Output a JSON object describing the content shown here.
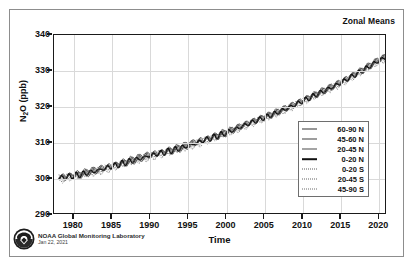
{
  "figure": {
    "title": "Zonal Means",
    "credit_lab": "NOAA Global Monitoring Laboratory",
    "credit_date": "Jan 22, 2021",
    "logo_name": "noaa-seal-logo"
  },
  "chart_data": {
    "type": "line",
    "title": "Zonal Means",
    "xlabel": "Time",
    "ylabel": "N2O (ppb)",
    "ylabel_parts": {
      "pre": "N",
      "sub": "2",
      "post": "O (ppb)"
    },
    "xlim": [
      1977.4,
      2021.0
    ],
    "ylim": [
      290,
      340
    ],
    "xticks": [
      1980,
      1985,
      1990,
      1995,
      2000,
      2005,
      2010,
      2015,
      2020
    ],
    "yticks": [
      290,
      300,
      310,
      320,
      330,
      340
    ],
    "grid": true,
    "legend_position": "lower right",
    "x": [
      1978,
      1979,
      1980,
      1981,
      1982,
      1983,
      1984,
      1985,
      1986,
      1987,
      1988,
      1989,
      1990,
      1991,
      1992,
      1993,
      1994,
      1995,
      1996,
      1997,
      1998,
      1999,
      2000,
      2001,
      2002,
      2003,
      2004,
      2005,
      2006,
      2007,
      2008,
      2009,
      2010,
      2011,
      2012,
      2013,
      2014,
      2015,
      2016,
      2017,
      2018,
      2019,
      2020,
      2020.8
    ],
    "series": [
      {
        "name": "60-90 N",
        "style": "solid-thin",
        "color": "#333333",
        "values": [
          300.6,
          300.9,
          301.2,
          301.6,
          302.1,
          302.6,
          303.2,
          303.8,
          304.4,
          305.0,
          305.6,
          306.2,
          306.8,
          307.3,
          307.8,
          308.3,
          308.9,
          309.6,
          310.3,
          311.0,
          311.7,
          312.4,
          313.2,
          314.0,
          314.9,
          315.8,
          316.6,
          317.4,
          318.2,
          319.1,
          320.0,
          321.0,
          322.0,
          323.0,
          324.0,
          325.0,
          326.0,
          327.1,
          328.3,
          329.5,
          330.7,
          332.0,
          333.3,
          334.0
        ]
      },
      {
        "name": "45-60 N",
        "style": "solid-thin",
        "color": "#3d3d3d",
        "values": [
          300.5,
          300.8,
          301.1,
          301.5,
          302.0,
          302.5,
          303.1,
          303.7,
          304.3,
          304.9,
          305.5,
          306.1,
          306.7,
          307.2,
          307.7,
          308.2,
          308.8,
          309.5,
          310.2,
          310.9,
          311.6,
          312.3,
          313.1,
          313.9,
          314.8,
          315.7,
          316.5,
          317.3,
          318.1,
          319.0,
          319.9,
          320.9,
          321.9,
          322.9,
          323.9,
          324.9,
          325.9,
          327.0,
          328.2,
          329.4,
          330.6,
          331.9,
          333.2,
          333.9
        ]
      },
      {
        "name": "20-45 N",
        "style": "solid-thin",
        "color": "#4a4a4a",
        "values": [
          300.4,
          300.7,
          301.0,
          301.4,
          301.9,
          302.4,
          303.0,
          303.6,
          304.2,
          304.8,
          305.4,
          306.0,
          306.6,
          307.1,
          307.6,
          308.1,
          308.7,
          309.4,
          310.1,
          310.8,
          311.5,
          312.2,
          313.0,
          313.8,
          314.7,
          315.6,
          316.4,
          317.2,
          318.0,
          318.9,
          319.8,
          320.8,
          321.8,
          322.8,
          323.8,
          324.8,
          325.8,
          326.9,
          328.1,
          329.3,
          330.5,
          331.8,
          333.1,
          333.8
        ]
      },
      {
        "name": "0-20 N",
        "style": "solid-thick",
        "color": "#111111",
        "values": [
          300.2,
          300.5,
          300.9,
          301.3,
          301.8,
          302.3,
          302.9,
          303.5,
          304.1,
          304.7,
          305.3,
          305.9,
          306.5,
          307.0,
          307.5,
          308.0,
          308.6,
          309.3,
          310.0,
          310.7,
          311.4,
          312.1,
          312.9,
          313.7,
          314.6,
          315.5,
          316.3,
          317.1,
          317.9,
          318.8,
          319.7,
          320.7,
          321.7,
          322.7,
          323.7,
          324.7,
          325.7,
          326.8,
          328.0,
          329.2,
          330.4,
          331.7,
          333.0,
          333.7
        ]
      },
      {
        "name": "0-20 S",
        "style": "dotted",
        "color": "#5a5a5a",
        "values": [
          300.0,
          300.3,
          300.7,
          301.1,
          301.6,
          302.1,
          302.7,
          303.3,
          303.9,
          304.5,
          305.1,
          305.7,
          306.3,
          306.8,
          307.3,
          307.8,
          308.4,
          309.1,
          309.8,
          310.5,
          311.2,
          311.9,
          312.7,
          313.5,
          314.4,
          315.3,
          316.1,
          316.9,
          317.7,
          318.6,
          319.5,
          320.5,
          321.5,
          322.5,
          323.5,
          324.5,
          325.5,
          326.6,
          327.8,
          329.0,
          330.2,
          331.5,
          332.8,
          333.5
        ]
      },
      {
        "name": "20-45 S",
        "style": "dotted",
        "color": "#636363",
        "values": [
          299.9,
          300.2,
          300.6,
          301.0,
          301.5,
          302.0,
          302.6,
          303.2,
          303.8,
          304.4,
          305.0,
          305.6,
          306.2,
          306.7,
          307.2,
          307.7,
          308.3,
          309.0,
          309.7,
          310.4,
          311.1,
          311.8,
          312.6,
          313.4,
          314.3,
          315.2,
          316.0,
          316.8,
          317.6,
          318.5,
          319.4,
          320.4,
          321.4,
          322.4,
          323.4,
          324.4,
          325.4,
          326.5,
          327.7,
          328.9,
          330.1,
          331.4,
          332.7,
          333.4
        ]
      },
      {
        "name": "45-90 S",
        "style": "dotted",
        "color": "#6b6b6b",
        "values": [
          299.8,
          300.1,
          300.5,
          300.9,
          301.4,
          301.9,
          302.5,
          303.1,
          303.7,
          304.3,
          304.9,
          305.5,
          306.1,
          306.6,
          307.1,
          307.6,
          308.2,
          308.9,
          309.6,
          310.3,
          311.0,
          311.7,
          312.5,
          313.3,
          314.2,
          315.1,
          315.9,
          316.7,
          317.5,
          318.4,
          319.3,
          320.3,
          321.3,
          322.3,
          323.3,
          324.3,
          325.3,
          326.4,
          327.6,
          328.8,
          330.0,
          331.3,
          332.6,
          333.3
        ]
      }
    ]
  }
}
